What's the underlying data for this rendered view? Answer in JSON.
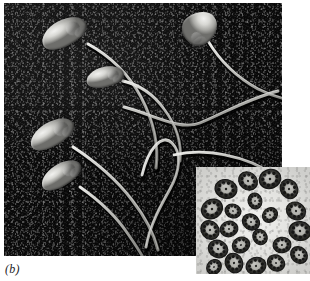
{
  "figure": {
    "caption_label": "(b)",
    "panel_name": "sperm-scanning-electron-micrograph",
    "colors": {
      "substrate_dark": "#0a0a0a",
      "cell_highlight": "#f2f2f0",
      "cell_midtone": "#a8a8a4",
      "cell_shadow": "#6e6e6b",
      "inset_background": "#e2e2df",
      "inset_structure_dark": "#2b2b29",
      "caption_text": "#1c1c1c",
      "page_background": "#ffffff"
    },
    "main_image": {
      "name": "sem-micrograph",
      "x": 4,
      "y": 3,
      "width": 278,
      "height": 253,
      "subject": "spermatozoa",
      "technique": "scanning electron microscopy",
      "sperm_count": 5,
      "sperm": [
        {
          "id": "sperm-upper-left",
          "head": {
            "cx": 60,
            "cy": 30,
            "rx": 24,
            "ry": 13,
            "rotate": -28
          },
          "tail_path": "M 84 41 C 106 53, 124 70, 137 94 C 150 119, 155 142, 152 165"
        },
        {
          "id": "sperm-upper-right",
          "head": {
            "cx": 196,
            "cy": 25,
            "rx": 16,
            "ry": 9,
            "rotate": 52
          },
          "tail_path": "M 204 38 C 216 58, 232 74, 254 86 C 268 93, 278 96, 290 98"
        },
        {
          "id": "sperm-middle",
          "head": {
            "cx": 101,
            "cy": 74,
            "rx": 19,
            "ry": 10,
            "rotate": -14
          },
          "tail_path": "M 119 78 C 136 82, 150 92, 160 106 C 172 122, 178 140, 176 158"
        },
        {
          "id": "sperm-lower-left-upper",
          "head": {
            "cx": 48,
            "cy": 131,
            "rx": 24,
            "ry": 12,
            "rotate": -30
          },
          "tail_path": "M 69 144 C 92 159, 112 176, 128 197 C 142 215, 150 231, 154 247"
        },
        {
          "id": "sperm-lower-left-lower",
          "head": {
            "cx": 57,
            "cy": 172,
            "rx": 22,
            "ry": 11,
            "rotate": -32
          },
          "tail_path": "M 76 184 C 96 198, 112 213, 124 231 C 133 244, 138 252, 141 258"
        }
      ],
      "free_flagella": [
        {
          "id": "flagellum-sweeping-right",
          "path": "M 120 104 C 150 112, 176 128, 196 120 C 220 110, 244 96, 274 88"
        },
        {
          "id": "flagellum-loop",
          "path": "M 138 172 C 144 146, 158 130, 168 140 C 178 150, 176 168, 166 186 C 156 204, 146 222, 142 244"
        },
        {
          "id": "flagellum-lower-sweep",
          "path": "M 170 152 C 196 146, 222 150, 248 160 C 262 166, 270 172, 276 178"
        }
      ]
    },
    "inset_image": {
      "name": "tem-inset",
      "x": 196,
      "y": 167,
      "width": 114,
      "height": 107,
      "subject": "flagellar axoneme cross sections",
      "technique": "transmission electron microscopy",
      "cross_section_count": 22,
      "cross_sections": [
        {
          "cx": 30,
          "cy": 22,
          "r": 11,
          "rot": 12
        },
        {
          "cx": 52,
          "cy": 14,
          "r": 10,
          "rot": 40
        },
        {
          "cx": 74,
          "cy": 12,
          "r": 11,
          "rot": -20
        },
        {
          "cx": 93,
          "cy": 22,
          "r": 10,
          "rot": 62
        },
        {
          "cx": 16,
          "cy": 42,
          "r": 11,
          "rot": -35
        },
        {
          "cx": 37,
          "cy": 44,
          "r": 8,
          "rot": 18
        },
        {
          "cx": 59,
          "cy": 34,
          "r": 8,
          "rot": 75
        },
        {
          "cx": 100,
          "cy": 44,
          "r": 10,
          "rot": 28
        },
        {
          "cx": 14,
          "cy": 63,
          "r": 10,
          "rot": 50
        },
        {
          "cx": 33,
          "cy": 62,
          "r": 9,
          "rot": -14
        },
        {
          "cx": 55,
          "cy": 55,
          "r": 9,
          "rot": 33
        },
        {
          "cx": 74,
          "cy": 48,
          "r": 8,
          "rot": -42
        },
        {
          "cx": 104,
          "cy": 64,
          "r": 11,
          "rot": 8
        },
        {
          "cx": 22,
          "cy": 82,
          "r": 10,
          "rot": 24
        },
        {
          "cx": 45,
          "cy": 78,
          "r": 9,
          "rot": -28
        },
        {
          "cx": 64,
          "cy": 70,
          "r": 8,
          "rot": 56
        },
        {
          "cx": 86,
          "cy": 78,
          "r": 9,
          "rot": -8
        },
        {
          "cx": 103,
          "cy": 88,
          "r": 9,
          "rot": 44
        },
        {
          "cx": 38,
          "cy": 96,
          "r": 10,
          "rot": 66
        },
        {
          "cx": 60,
          "cy": 99,
          "r": 10,
          "rot": -18
        },
        {
          "cx": 80,
          "cy": 96,
          "r": 9,
          "rot": 30
        },
        {
          "cx": 18,
          "cy": 100,
          "r": 8,
          "rot": -50
        }
      ]
    }
  }
}
